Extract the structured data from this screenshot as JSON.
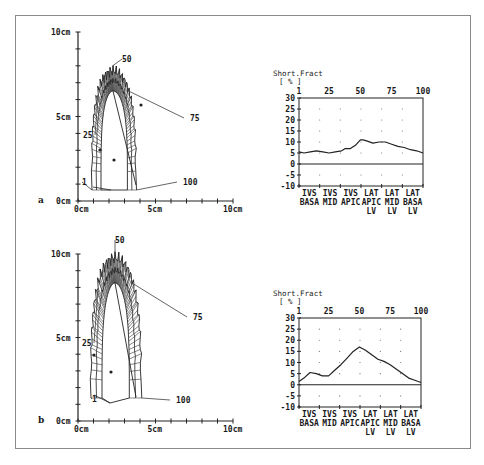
{
  "figure": {
    "panels": [
      {
        "id": "a",
        "label": "a",
        "contour_plot": {
          "y_axis_labels": [
            "10cm",
            "5cm",
            "0cm"
          ],
          "x_axis_labels": [
            "0cm",
            "5cm",
            "10cm"
          ],
          "segment_labels": [
            "1",
            "25",
            "50",
            "75",
            "100"
          ]
        },
        "sf_chart": {
          "title": "Short.Fract",
          "unit": "[ % ]"
        }
      },
      {
        "id": "b",
        "label": "b",
        "contour_plot": {
          "y_axis_labels": [
            "10cm",
            "5cm",
            "0cm"
          ],
          "x_axis_labels": [
            "0cm",
            "5cm",
            "10cm"
          ],
          "segment_labels": [
            "1",
            "25",
            "50",
            "75",
            "100"
          ]
        },
        "sf_chart": {
          "title": "Short.Fract",
          "unit": "[ % ]"
        }
      }
    ]
  },
  "chart_data": [
    {
      "type": "line",
      "panel": "a",
      "title": "Short.Fract",
      "ylabel": "[ % ]",
      "xlabel": "",
      "x_tick_labels": [
        "1",
        "25",
        "50",
        "75",
        "100"
      ],
      "y_tick_labels": [
        "30",
        "25",
        "20",
        "15",
        "10",
        "5",
        "0",
        "-5",
        "-10"
      ],
      "ylim": [
        -10,
        30
      ],
      "xlim": [
        1,
        100
      ],
      "grid": "dots",
      "region_labels": [
        [
          "IVS",
          "BASA",
          ""
        ],
        [
          "IVS",
          "MID",
          ""
        ],
        [
          "IVS",
          "APIC",
          ""
        ],
        [
          "LAT",
          "APIC",
          "LV"
        ],
        [
          "LAT",
          "MID",
          "LV"
        ],
        [
          "LAT",
          "BASA",
          "LV"
        ]
      ],
      "series": [
        {
          "name": "Shortening fraction",
          "x": [
            1,
            5,
            10,
            15,
            20,
            25,
            30,
            35,
            38,
            42,
            46,
            50,
            52,
            55,
            60,
            65,
            70,
            75,
            80,
            85,
            90,
            95,
            100
          ],
          "values": [
            5.5,
            5,
            5.5,
            6,
            5.5,
            5,
            5.5,
            6,
            7,
            7,
            8.5,
            11,
            11,
            10.5,
            9.5,
            10,
            10,
            9,
            8,
            7.5,
            6.5,
            6,
            5
          ]
        }
      ]
    },
    {
      "type": "line",
      "panel": "b",
      "title": "Short.Fract",
      "ylabel": "[ % ]",
      "xlabel": "",
      "x_tick_labels": [
        "1",
        "25",
        "50",
        "75",
        "100"
      ],
      "y_tick_labels": [
        "30",
        "25",
        "20",
        "15",
        "10",
        "5",
        "0",
        "-5",
        "-10"
      ],
      "ylim": [
        -10,
        30
      ],
      "xlim": [
        1,
        100
      ],
      "grid": "dots",
      "region_labels": [
        [
          "IVS",
          "BASA",
          ""
        ],
        [
          "IVS",
          "MID",
          ""
        ],
        [
          "IVS",
          "APIC",
          ""
        ],
        [
          "LAT",
          "APIC",
          "LV"
        ],
        [
          "LAT",
          "MID",
          "LV"
        ],
        [
          "LAT",
          "BASA",
          "LV"
        ]
      ],
      "series": [
        {
          "name": "Shortening fraction",
          "x": [
            1,
            5,
            10,
            15,
            20,
            25,
            30,
            35,
            40,
            45,
            50,
            55,
            60,
            65,
            70,
            75,
            80,
            85,
            90,
            95,
            100
          ],
          "values": [
            1.5,
            3,
            5.5,
            5,
            4,
            4,
            6.5,
            9,
            12,
            15,
            17,
            15.5,
            13.5,
            11.5,
            10.5,
            9,
            7,
            5,
            3,
            2,
            1
          ]
        }
      ]
    }
  ]
}
